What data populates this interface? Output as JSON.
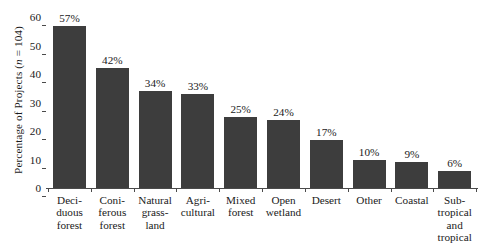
{
  "chart_data": {
    "type": "bar",
    "title": "",
    "subtitle": "",
    "xlabel": "",
    "ylabel": "Percentage of Projects (n = 104)",
    "ylabel_parts": {
      "before": "Percentage of Projects (",
      "italic": "n",
      "after": " = 104)"
    },
    "ylim": [
      0,
      60
    ],
    "yticks": [
      0,
      10,
      20,
      30,
      40,
      50,
      60
    ],
    "ytick_labels": [
      "0",
      "10",
      "20",
      "30",
      "40",
      "50",
      "60"
    ],
    "grid": false,
    "legend": null,
    "bar_color": "#3d3d3d",
    "axis_color": "#4a4a4a",
    "sample_size": 104,
    "value_suffix": "%",
    "categories": [
      "Deciduous forest",
      "Coniferous forest",
      "Natural grassland",
      "Agricultural",
      "Mixed forest",
      "Open wetland",
      "Desert",
      "Other",
      "Coastal",
      "Subtropical and tropical"
    ],
    "category_label_lines": [
      [
        "Deci-",
        "duous",
        "forest"
      ],
      [
        "Coni-",
        "ferous",
        "forest"
      ],
      [
        "Natural",
        "grass-",
        "land"
      ],
      [
        "Agri-",
        "cultural"
      ],
      [
        "Mixed",
        "forest"
      ],
      [
        "Open",
        "wetland"
      ],
      [
        "Desert"
      ],
      [
        "Other"
      ],
      [
        "Coastal"
      ],
      [
        "Sub-",
        "tropical",
        "and",
        "tropical"
      ]
    ],
    "values": [
      57,
      42,
      34,
      33,
      25,
      24,
      17,
      10,
      9,
      6
    ],
    "value_labels": [
      "57%",
      "42%",
      "34%",
      "33%",
      "25%",
      "24%",
      "17%",
      "10%",
      "9%",
      "6%"
    ]
  }
}
